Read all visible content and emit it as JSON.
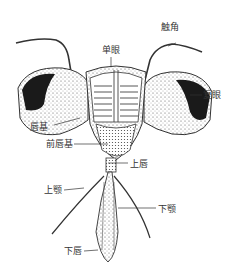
{
  "diagram": {
    "labels": {
      "antenna": "触角",
      "ocellus": "单眼",
      "compound_eye": "复眼",
      "postclypeus": "唇基",
      "anteclypeus": "前唇基",
      "labrum": "上唇",
      "mandible": "上颚",
      "maxilla": "下颚",
      "labium": "下唇"
    }
  }
}
